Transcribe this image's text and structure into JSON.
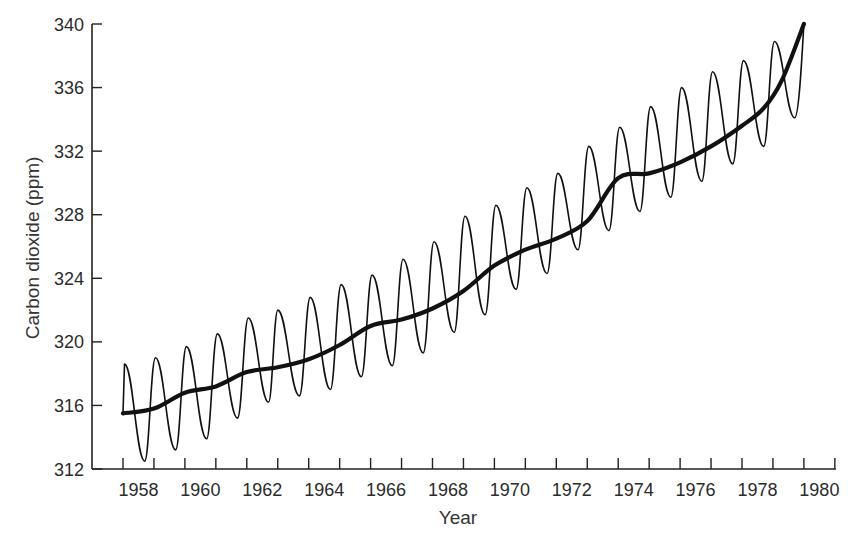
{
  "chart_data": {
    "type": "line",
    "title": "",
    "xlabel": "Year",
    "ylabel": "Carbon dioxide (ppm)",
    "xlim": [
      1958,
      1981
    ],
    "ylim": [
      312,
      340
    ],
    "grid": false,
    "legend": null,
    "x_tick_labels": [
      "1958",
      "1960",
      "1962",
      "1964",
      "1966",
      "1968",
      "1970",
      "1972",
      "1974",
      "1976",
      "1978",
      "1980"
    ],
    "x_minor_ticks_every_year": true,
    "y_ticks": [
      312,
      316,
      320,
      324,
      328,
      332,
      336,
      340
    ],
    "series": [
      {
        "name": "Monthly CO2 (seasonal oscillation)",
        "style": "thin",
        "x": [
          1958.0,
          1958.05,
          1958.7,
          1959.05,
          1959.7,
          1960.05,
          1960.7,
          1961.05,
          1961.7,
          1962.05,
          1962.7,
          1963.0,
          1963.7,
          1964.05,
          1964.7,
          1965.05,
          1965.7,
          1966.05,
          1966.7,
          1967.05,
          1967.7,
          1968.05,
          1968.7,
          1969.05,
          1969.7,
          1970.05,
          1970.7,
          1971.05,
          1971.7,
          1972.05,
          1972.7,
          1973.05,
          1973.7,
          1974.05,
          1974.7,
          1975.05,
          1975.7,
          1976.05,
          1976.7,
          1977.05,
          1977.7,
          1978.05,
          1978.7,
          1979.05,
          1979.7,
          1980.0
        ],
        "values": [
          315.5,
          318.6,
          312.5,
          319.0,
          313.2,
          319.7,
          313.9,
          320.5,
          315.2,
          321.5,
          316.2,
          322.0,
          316.6,
          322.8,
          317.0,
          323.6,
          317.8,
          324.2,
          318.5,
          325.2,
          319.3,
          326.3,
          320.6,
          327.9,
          321.7,
          328.6,
          323.3,
          329.7,
          324.3,
          330.6,
          325.8,
          332.3,
          327.0,
          333.5,
          328.2,
          334.8,
          329.1,
          336.0,
          330.1,
          337.0,
          331.2,
          337.7,
          332.3,
          338.9,
          334.1,
          340.0
        ]
      },
      {
        "name": "Smoothed trend",
        "style": "thick",
        "x": [
          1958.0,
          1959.0,
          1960.0,
          1961.0,
          1962.0,
          1963.0,
          1964.0,
          1965.0,
          1966.0,
          1967.0,
          1968.0,
          1969.0,
          1970.0,
          1971.0,
          1972.0,
          1973.0,
          1974.0,
          1975.0,
          1976.0,
          1977.0,
          1978.0,
          1978.7,
          1979.3,
          1980.0
        ],
        "values": [
          315.5,
          315.8,
          316.8,
          317.2,
          318.1,
          318.4,
          318.9,
          319.8,
          321.0,
          321.4,
          322.1,
          323.2,
          324.8,
          325.8,
          326.5,
          327.6,
          330.3,
          330.6,
          331.3,
          332.3,
          333.6,
          334.7,
          336.5,
          340.0
        ]
      }
    ]
  },
  "axes": {
    "x_title": "Year",
    "y_title": "Carbon dioxide (ppm)"
  }
}
